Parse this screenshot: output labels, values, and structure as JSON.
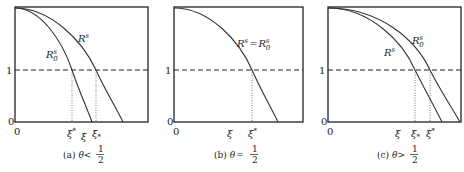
{
  "figure": {
    "panels": [
      {
        "id": "a",
        "caption_prefix": "(a)",
        "caption_theta": "θ",
        "caption_relation": "<",
        "caption_frac_num": "1",
        "caption_frac_den": "2",
        "y_ticks": [
          "0",
          "1"
        ],
        "x_origin": "0",
        "curves": [
          {
            "label": "R",
            "sup": "s",
            "sub": "0",
            "name": "R0s"
          },
          {
            "label": "R",
            "sup": "s",
            "sub": "",
            "name": "Rs"
          }
        ],
        "x_labels": [
          {
            "text": "ξ",
            "mark": "*",
            "pos": "sup"
          },
          {
            "text": "ξ",
            "mark": "",
            "pos": ""
          },
          {
            "text": "ξ",
            "mark": "*",
            "pos": "sub"
          }
        ]
      },
      {
        "id": "b",
        "caption_prefix": "(b)",
        "caption_theta": "θ",
        "caption_relation": "=",
        "caption_frac_num": "1",
        "caption_frac_den": "2",
        "y_ticks": [
          "0",
          "1"
        ],
        "x_origin": "0",
        "curves": [
          {
            "label": "R",
            "sup": "s",
            "sub": "",
            "name": "Rs",
            "eq": "=",
            "label2": "R",
            "sup2": "s",
            "sub2": "0"
          }
        ],
        "x_labels": [
          {
            "text": "ξ",
            "mark": "",
            "pos": ""
          },
          {
            "text": "ξ",
            "mark": "*",
            "pos": "sup"
          }
        ]
      },
      {
        "id": "c",
        "caption_prefix": "(c)",
        "caption_theta": "θ",
        "caption_relation": ">",
        "caption_frac_num": "1",
        "caption_frac_den": "2",
        "y_ticks": [
          "0",
          "1"
        ],
        "x_origin": "0",
        "curves": [
          {
            "label": "R",
            "sup": "s",
            "sub": "0",
            "name": "R0s"
          },
          {
            "label": "R",
            "sup": "s",
            "sub": "",
            "name": "Rs"
          }
        ],
        "x_labels": [
          {
            "text": "ξ",
            "mark": "",
            "pos": ""
          },
          {
            "text": "ξ",
            "mark": "*",
            "pos": "sub"
          },
          {
            "text": "ξ",
            "mark": "*",
            "pos": "sup"
          }
        ]
      }
    ]
  }
}
